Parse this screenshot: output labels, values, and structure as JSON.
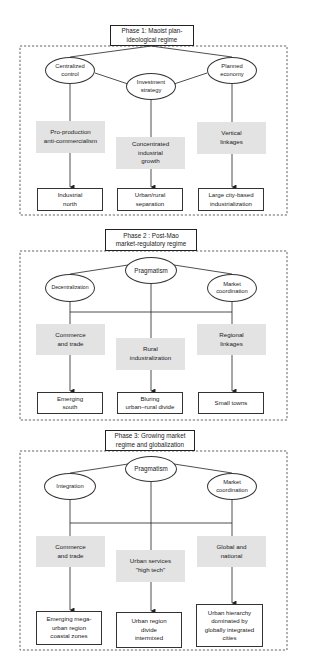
{
  "phases": [
    {
      "title": "Phase 1: Maoist plan-\nideological regime",
      "drivers": [
        {
          "label": "Centralized\ncontrol"
        },
        {
          "label": "Investment\nstrategy"
        },
        {
          "label": "Planned\neconomy"
        }
      ],
      "mechanisms": [
        {
          "label": "Pro-production\nanti-commercialism"
        },
        {
          "label": "Concentrated\nindustrial\ngrowth"
        },
        {
          "label": "Vertical\nlinkages"
        }
      ],
      "outcomes": [
        {
          "label": "Industrial\nnorth"
        },
        {
          "label": "Urban/rural\nseparation"
        },
        {
          "label": "Large city-based\nindustrialization"
        }
      ]
    },
    {
      "title": "Phase 2 : Post-Mao\nmarket-regulatory regime",
      "drivers": [
        {
          "label": "Decentralization"
        },
        {
          "label": "Pragmatism"
        },
        {
          "label": "Market\ncoordination"
        }
      ],
      "mechanisms": [
        {
          "label": "Commerce\nand trade"
        },
        {
          "label": "Rural\nindustralization"
        },
        {
          "label": "Regional\nlinkages"
        }
      ],
      "outcomes": [
        {
          "label": "Emerging\nsouth"
        },
        {
          "label": "Bluring\nurban–rural divide"
        },
        {
          "label": "Small towns"
        }
      ]
    },
    {
      "title": "Phase 3: Growing market\nregime and globalization",
      "drivers": [
        {
          "label": "Integration"
        },
        {
          "label": "Pragmatism"
        },
        {
          "label": "Market\ncoordination"
        }
      ],
      "mechanisms": [
        {
          "label": "Commerce\nand trade"
        },
        {
          "label": "Urban services\n\"high tech\""
        },
        {
          "label": "Global and\nnational"
        }
      ],
      "outcomes": [
        {
          "label": "Emerging mega-\nurban region\ncoastal zones"
        },
        {
          "label": "Urban region\ndivide\nintermixed"
        },
        {
          "label": "Urban hierarchy\ndominated by\nglobally integrated\ncities"
        }
      ]
    }
  ],
  "colors": {
    "mechanism_fill": "#e3e3e3",
    "line": "#222222",
    "background": "#ffffff"
  }
}
